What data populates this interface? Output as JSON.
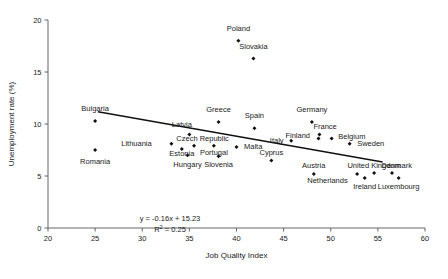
{
  "chart_data": {
    "type": "scatter",
    "title": "",
    "xlabel": "Job Quality Index",
    "ylabel": "Unemployment rate (%)",
    "xlim": [
      20,
      60
    ],
    "ylim": [
      0,
      20
    ],
    "xticks": [
      20,
      25,
      30,
      35,
      40,
      45,
      50,
      55,
      60
    ],
    "yticks": [
      0,
      5,
      10,
      15,
      20
    ],
    "grid": false,
    "legend": "none",
    "annotations": {
      "equation": "y = -0.16x + 15.23",
      "r_squared": "R  = 0.25",
      "r_squared_base": "R",
      "r_squared_sup": "2",
      "r_squared_rest": "= 0.25"
    },
    "trendline": {
      "slope": -0.16,
      "intercept": 15.23,
      "x_start": 25.3,
      "x_end": 55.5
    },
    "points": [
      {
        "label": "Poland",
        "x": 40.2,
        "y": 18.0,
        "lx": 40.2,
        "ly": 19.2,
        "anchor": "middle"
      },
      {
        "label": "Slovakia",
        "x": 41.8,
        "y": 16.3,
        "lx": 41.8,
        "ly": 17.5,
        "anchor": "middle"
      },
      {
        "label": "Bulgaria",
        "x": 25.0,
        "y": 10.3,
        "lx": 25.0,
        "ly": 11.5,
        "anchor": "middle"
      },
      {
        "label": "Romania",
        "x": 25.0,
        "y": 7.5,
        "lx": 25.0,
        "ly": 6.4,
        "anchor": "middle"
      },
      {
        "label": "Greece",
        "x": 38.1,
        "y": 10.2,
        "lx": 38.1,
        "ly": 11.4,
        "anchor": "middle"
      },
      {
        "label": "Spain",
        "x": 41.9,
        "y": 9.6,
        "lx": 41.9,
        "ly": 10.8,
        "anchor": "middle"
      },
      {
        "label": "Germany",
        "x": 48.0,
        "y": 10.2,
        "lx": 48.0,
        "ly": 11.4,
        "anchor": "middle"
      },
      {
        "label": "Latvia",
        "x": 35.0,
        "y": 9.0,
        "lx": 34.2,
        "ly": 10.0,
        "anchor": "middle"
      },
      {
        "label": "Lithuania",
        "x": 33.1,
        "y": 8.1,
        "lx": 31.0,
        "ly": 8.1,
        "anchor": "end"
      },
      {
        "label": "Czech Republic",
        "x": 35.5,
        "y": 7.9,
        "lx": 36.4,
        "ly": 8.6,
        "anchor": "middle"
      },
      {
        "label": "Estonia",
        "x": 34.2,
        "y": 7.6,
        "lx": 34.2,
        "ly": 7.2,
        "anchor": "middle"
      },
      {
        "label": "Hungary",
        "x": 34.8,
        "y": 7.0,
        "lx": 34.8,
        "ly": 6.1,
        "anchor": "middle"
      },
      {
        "label": "Portugal",
        "x": 37.6,
        "y": 7.9,
        "lx": 37.6,
        "ly": 7.3,
        "anchor": "middle"
      },
      {
        "label": "Slovenia",
        "x": 38.1,
        "y": 6.9,
        "lx": 38.1,
        "ly": 6.1,
        "anchor": "middle"
      },
      {
        "label": "Malta",
        "x": 40.0,
        "y": 7.8,
        "lx": 40.8,
        "ly": 7.8,
        "anchor": "start"
      },
      {
        "label": "Cyprus",
        "x": 43.7,
        "y": 6.5,
        "lx": 43.7,
        "ly": 7.3,
        "anchor": "middle"
      },
      {
        "label": "Italy",
        "x": 45.8,
        "y": 8.4,
        "lx": 45.0,
        "ly": 8.4,
        "anchor": "end"
      },
      {
        "label": "Finland",
        "x": 48.7,
        "y": 8.6,
        "lx": 47.8,
        "ly": 8.9,
        "anchor": "end"
      },
      {
        "label": "France",
        "x": 48.8,
        "y": 9.0,
        "lx": 49.4,
        "ly": 9.8,
        "anchor": "middle"
      },
      {
        "label": "Belgium",
        "x": 50.1,
        "y": 8.6,
        "lx": 50.8,
        "ly": 8.8,
        "anchor": "start"
      },
      {
        "label": "Sweden",
        "x": 52.0,
        "y": 8.1,
        "lx": 52.8,
        "ly": 8.1,
        "anchor": "start"
      },
      {
        "label": "Austria",
        "x": 48.2,
        "y": 5.2,
        "lx": 48.2,
        "ly": 6.0,
        "anchor": "middle"
      },
      {
        "label": "Netherlands",
        "x": 52.8,
        "y": 5.2,
        "lx": 51.8,
        "ly": 4.6,
        "anchor": "end"
      },
      {
        "label": "Ireland",
        "x": 53.6,
        "y": 4.8,
        "lx": 53.6,
        "ly": 4.0,
        "anchor": "middle"
      },
      {
        "label": "United Kingdom",
        "x": 54.6,
        "y": 5.3,
        "lx": 54.6,
        "ly": 6.0,
        "anchor": "middle"
      },
      {
        "label": "Denmark",
        "x": 56.5,
        "y": 5.3,
        "lx": 57.0,
        "ly": 6.0,
        "anchor": "middle"
      },
      {
        "label": "Luxembourg",
        "x": 57.2,
        "y": 4.8,
        "lx": 57.2,
        "ly": 4.0,
        "anchor": "middle"
      }
    ]
  }
}
